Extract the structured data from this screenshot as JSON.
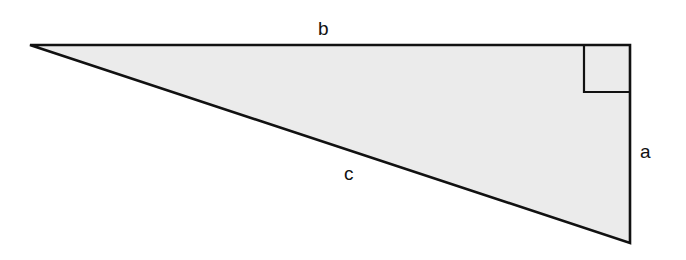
{
  "diagram": {
    "title": "",
    "type": "right-triangle",
    "fill_color": "#ebebeb",
    "stroke_color": "#111111",
    "vertices": {
      "left": [
        30,
        45
      ],
      "top_right": [
        630,
        45
      ],
      "bottom_right": [
        630,
        243
      ]
    },
    "right_angle_marker": {
      "x": 584,
      "y": 45,
      "size": 46
    },
    "labels": {
      "b": "b",
      "a": "a",
      "c": "c"
    },
    "sides": [
      {
        "name": "b",
        "description": "top horizontal leg"
      },
      {
        "name": "a",
        "description": "right vertical leg"
      },
      {
        "name": "c",
        "description": "hypotenuse"
      }
    ]
  }
}
